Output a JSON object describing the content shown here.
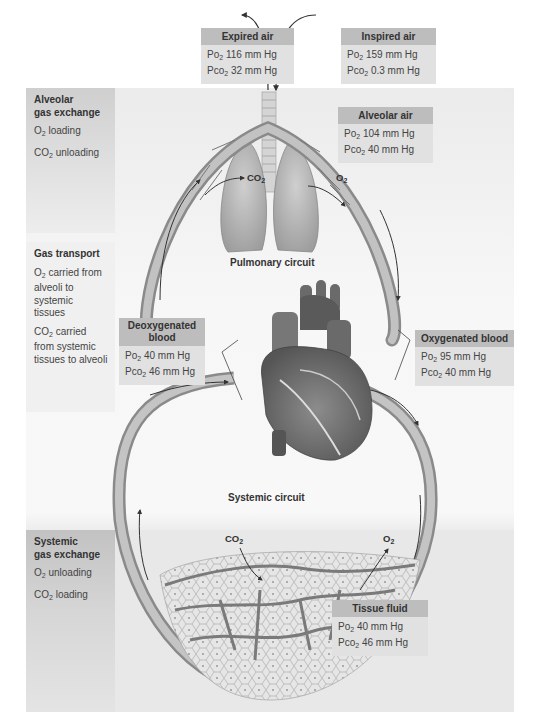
{
  "sidebar": {
    "alveolar": {
      "title_line1": "Alveolar",
      "title_line2": "gas exchange",
      "items": [
        {
          "gas": "O",
          "sub": "2",
          "text": " loading"
        },
        {
          "gas": "CO",
          "sub": "2",
          "text": " unloading"
        }
      ]
    },
    "transport": {
      "title": "Gas transport",
      "items": [
        {
          "gas": "O",
          "sub": "2",
          "text": " carried from alveoli to systemic tissues"
        },
        {
          "gas": "CO",
          "sub": "2",
          "text": " carried from systemic tissues to alveoli"
        }
      ]
    },
    "systemic": {
      "title_line1": "Systemic",
      "title_line2": "gas exchange",
      "items": [
        {
          "gas": "O",
          "sub": "2",
          "text": " unloading"
        },
        {
          "gas": "CO",
          "sub": "2",
          "text": " loading"
        }
      ]
    }
  },
  "boxes": {
    "expired_air": {
      "title": "Expired air",
      "po2": "116 mm Hg",
      "pco2": "32 mm Hg"
    },
    "inspired_air": {
      "title": "Inspired air",
      "po2": "159 mm Hg",
      "pco2": "0.3 mm Hg"
    },
    "alveolar_air": {
      "title": "Alveolar air",
      "po2": "104 mm Hg",
      "pco2": "40 mm Hg"
    },
    "deoxygenated_blood": {
      "title_line1": "Deoxygenated",
      "title_line2": "blood",
      "po2": "40 mm Hg",
      "pco2": "46 mm Hg"
    },
    "oxygenated_blood": {
      "title": "Oxygenated blood",
      "po2": "95 mm Hg",
      "pco2": "40 mm Hg"
    },
    "tissue_fluid": {
      "title": "Tissue fluid",
      "po2": "40 mm Hg",
      "pco2": "46 mm Hg"
    }
  },
  "labels": {
    "po2_prefix": "Po",
    "pco2_prefix": "Pco",
    "sub2": "2",
    "pulmonary_circuit": "Pulmonary circuit",
    "systemic_circuit": "Systemic circuit",
    "lung_co2": "CO",
    "lung_o2": "O",
    "tissue_co2": "CO",
    "tissue_o2": "O"
  },
  "colors": {
    "header_fill": "#bdbdbd",
    "box_fill": "#e1e1e1",
    "vessel": "#8a8a8a",
    "vessel_dark": "#555555"
  }
}
